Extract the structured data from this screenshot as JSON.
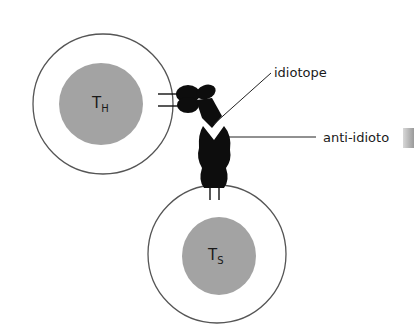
{
  "figure": {
    "type": "schematic"
  },
  "cells": [
    {
      "id": "helper",
      "label_main": "T",
      "label_sub": "H"
    },
    {
      "id": "suppressor",
      "label_main": "T",
      "label_sub": "S"
    }
  ],
  "labels": {
    "idiotope": "idiotope",
    "anti_idiotope": "anti-idioto"
  },
  "colors": {
    "nucleus": "#9e9e9e",
    "membrane": "#555555",
    "receptor": "#0d0d0d",
    "leader_line": "#222222"
  }
}
